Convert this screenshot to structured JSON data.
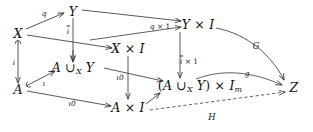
{
  "diagram": {
    "type": "commutative-diagram",
    "nodes": [
      {
        "id": "X",
        "label": "X",
        "x": 18,
        "y": 33
      },
      {
        "id": "Y",
        "label": "Y",
        "x": 73,
        "y": 11
      },
      {
        "id": "XI",
        "label": "X × I",
        "x": 128,
        "y": 48
      },
      {
        "id": "YI",
        "label": "Y × I",
        "x": 198,
        "y": 24
      },
      {
        "id": "A",
        "label": "A",
        "x": 18,
        "y": 89
      },
      {
        "id": "AUXY",
        "label": "A ∪X Y",
        "x": 73,
        "y": 68
      },
      {
        "id": "AI",
        "label": "A × I",
        "x": 128,
        "y": 107
      },
      {
        "id": "AUXYIm",
        "label": "(A ∪X Y) × Im",
        "x": 200,
        "y": 86
      },
      {
        "id": "Z",
        "label": "Z",
        "x": 294,
        "y": 87
      }
    ],
    "edges": [
      {
        "id": "X-to-Y",
        "label": "q",
        "from": "X",
        "to": "Y",
        "style": "solid",
        "label_x": 44,
        "label_y": 13
      },
      {
        "id": "Y-to-XI",
        "label": "ī",
        "from": "Y",
        "to": "XI",
        "style": "solid",
        "label_x": 68,
        "label_y": 31
      },
      {
        "id": "X-to-XI",
        "label": "",
        "from": "X",
        "to": "XI",
        "style": "solid",
        "label_x": 0,
        "label_y": 0
      },
      {
        "id": "Y-to-YI",
        "label": "q × 1",
        "from": "Y",
        "to": "YI",
        "style": "solid",
        "label_x": 160,
        "label_y": 26
      },
      {
        "id": "XI-to-YI",
        "label": "",
        "from": "XI",
        "to": "YI",
        "style": "solid",
        "label_x": 0,
        "label_y": 0
      },
      {
        "id": "X-to-A",
        "label": "i",
        "from": "X",
        "to": "A",
        "style": "solid",
        "label_x": 14,
        "label_y": 62
      },
      {
        "id": "Y-to-AUXY",
        "label": "",
        "from": "Y",
        "to": "AUXY",
        "style": "solid",
        "label_x": 0,
        "label_y": 0
      },
      {
        "id": "A-to-AUXY",
        "label": "ι",
        "from": "A",
        "to": "AUXY",
        "style": "solid",
        "label_x": 44,
        "label_y": 83
      },
      {
        "id": "AUXY-to-AUXYIm",
        "label": "ι0",
        "from": "AUXY",
        "to": "AUXYIm",
        "style": "solid",
        "label_x": 120,
        "label_y": 77
      },
      {
        "id": "A-to-AI",
        "label": "ι0",
        "from": "A",
        "to": "AI",
        "style": "solid",
        "label_x": 72,
        "label_y": 103
      },
      {
        "id": "XI-to-AI",
        "label": "",
        "from": "XI",
        "to": "AI",
        "style": "solid",
        "label_x": 0,
        "label_y": 0
      },
      {
        "id": "AI-to-AUXYIm",
        "label": "",
        "from": "AI",
        "to": "AUXYIm",
        "style": "solid",
        "label_x": 0,
        "label_y": 0
      },
      {
        "id": "YI-to-AUXYIm",
        "label": "ī × 1",
        "from": "YI",
        "to": "AUXYIm",
        "style": "solid",
        "label_x": 189,
        "label_y": 61
      },
      {
        "id": "YI-to-Z",
        "label": "G",
        "from": "YI",
        "to": "Z",
        "style": "solid",
        "label_x": 256,
        "label_y": 46
      },
      {
        "id": "AUXYIm-to-Z",
        "label": "g",
        "from": "AUXYIm",
        "to": "Z",
        "style": "solid",
        "label_x": 247,
        "label_y": 73
      },
      {
        "id": "AI-to-Z",
        "label": "H",
        "from": "AI",
        "to": "Z",
        "style": "dashed",
        "label_x": 212,
        "label_y": 117
      }
    ],
    "colors": {
      "stroke": "#3a3a3a",
      "text": "#111111",
      "background": "#ffffff"
    }
  }
}
